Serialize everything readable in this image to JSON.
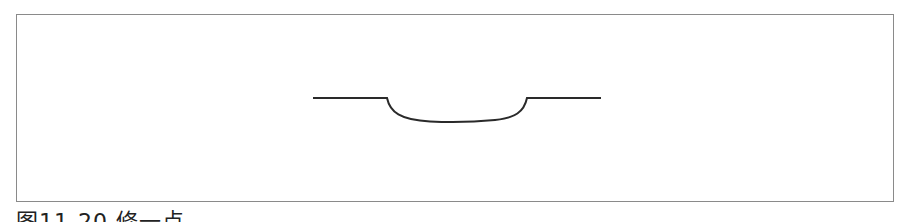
{
  "figure": {
    "caption": "图11-20 修一点",
    "caption_note": "caption partially clipped at bottom edge",
    "frame": {
      "border_color": "#8a8a8a"
    },
    "profile": {
      "stroke_color": "#2a2a2a",
      "description": "horizontal line with a shallow rounded depression in the middle",
      "left_segment": {
        "x1": 313,
        "x2": 387,
        "y": 98
      },
      "depression": {
        "x_start": 387,
        "x_end": 527,
        "bottom_y": 122
      },
      "right_segment": {
        "x1": 527,
        "x2": 601,
        "y": 98
      }
    }
  }
}
